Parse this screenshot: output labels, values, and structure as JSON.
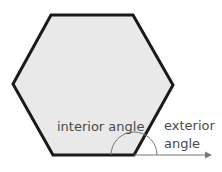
{
  "diagram": {
    "shape": "regular hexagon",
    "labels": {
      "interior": "interior angle",
      "exterior_line1": "exterior",
      "exterior_line2": "angle"
    },
    "colors": {
      "fill": "#e9e9e9",
      "outline": "#1a1a1a",
      "annotation": "#777777",
      "text": "#4a4a4a"
    }
  }
}
